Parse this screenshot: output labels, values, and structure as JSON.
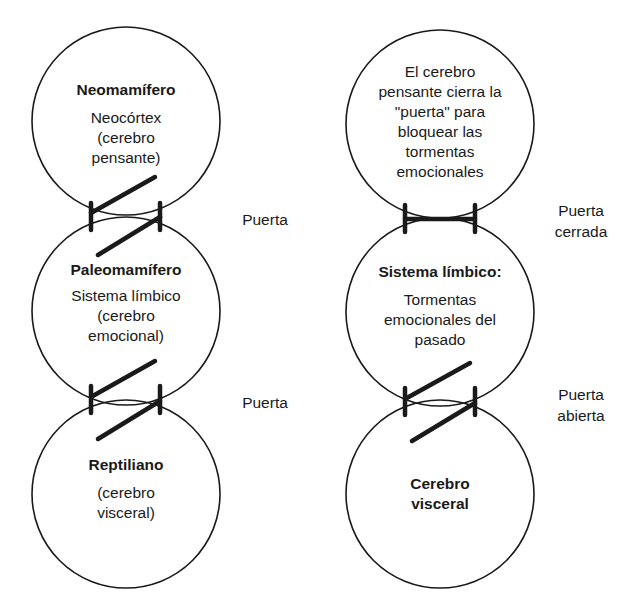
{
  "diagram": {
    "left_column": {
      "circles": [
        {
          "title": "Neomamífero",
          "body": "Neocórtex\n(cerebro\npensante)"
        },
        {
          "title": "Paleomamífero",
          "body": "Sistema límbico\n(cerebro\nemocional)"
        },
        {
          "title": "Reptiliano",
          "body": "(cerebro\nvisceral)"
        }
      ],
      "gates": [
        {
          "label": "Puerta",
          "state": "open"
        },
        {
          "label": "Puerta",
          "state": "open"
        }
      ]
    },
    "right_column": {
      "circles": [
        {
          "title": "",
          "body": "El cerebro\npensante cierra la\n\"puerta\" para\nbloquear las\ntormentas\nemocionales"
        },
        {
          "title": "Sistema límbico:",
          "body": "Tormentas\nemocionales del\npasado"
        },
        {
          "title": "Cerebro\nvisceral",
          "body": ""
        }
      ],
      "gates": [
        {
          "label": "Puerta\ncerrada",
          "state": "closed"
        },
        {
          "label": "Puerta\nabierta",
          "state": "open"
        }
      ]
    },
    "colors": {
      "line": "#1a1a1a",
      "background": "#ffffff"
    }
  }
}
